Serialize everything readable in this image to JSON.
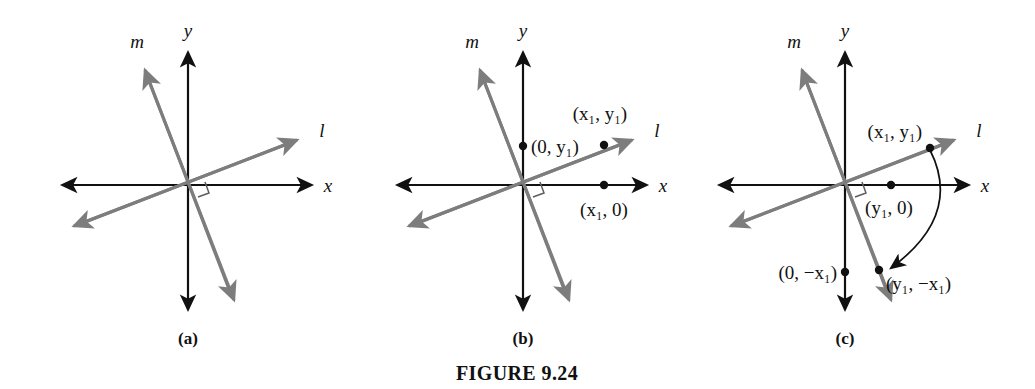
{
  "figure": {
    "caption": "FIGURE 9.24",
    "background_color": "#ffffff",
    "axis_color": "#111111",
    "line_color": "#7d7d7d",
    "arc_color": "#111111"
  },
  "panels": [
    {
      "id": "a",
      "label": "(a)",
      "axis_labels": {
        "x": "x",
        "y": "y"
      },
      "line_labels": {
        "l": "l",
        "m": "m"
      },
      "right_angle_marker": true,
      "points": []
    },
    {
      "id": "b",
      "label": "(b)",
      "axis_labels": {
        "x": "x",
        "y": "y"
      },
      "line_labels": {
        "l": "l",
        "m": "m"
      },
      "right_angle_marker": true,
      "points": [
        {
          "name": "point-0-y1",
          "label": "(0, y₁)"
        },
        {
          "name": "point-x1-y1",
          "label": "(x₁, y₁)"
        },
        {
          "name": "point-x1-0",
          "label": "(x₁, 0)"
        }
      ]
    },
    {
      "id": "c",
      "label": "(c)",
      "axis_labels": {
        "x": "x",
        "y": "y"
      },
      "line_labels": {
        "l": "l",
        "m": "m"
      },
      "right_angle_marker": true,
      "rotation_arc": true,
      "points": [
        {
          "name": "point-x1-y1",
          "label": "(x₁, y₁)"
        },
        {
          "name": "point-y1-0",
          "label": "(y₁, 0)"
        },
        {
          "name": "point-0-negx1",
          "label": "(0, −x₁)"
        },
        {
          "name": "point-y1-negx1",
          "label": "(y₁, −x₁)"
        }
      ]
    }
  ]
}
